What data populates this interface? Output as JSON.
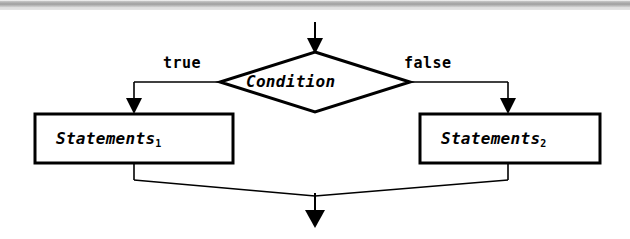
{
  "diagram": {
    "decision": {
      "label": "Condition",
      "shape": "diamond"
    },
    "branches": [
      {
        "label": "true",
        "side": "left"
      },
      {
        "label": "false",
        "side": "right"
      }
    ],
    "processes": [
      {
        "label": "Statements",
        "subscript": "1",
        "side": "left"
      },
      {
        "label": "Statements",
        "subscript": "2",
        "side": "right"
      }
    ],
    "flow": {
      "entry_arrow": "arrow-down-icon",
      "exit_arrow": "arrow-down-icon",
      "true_branch_arrow": "arrow-down-icon",
      "false_branch_arrow": "arrow-down-icon"
    },
    "colors": {
      "stroke": "#000000",
      "background": "#ffffff",
      "connector": "#1a1a1a",
      "scan_edge": "#9a9a9a"
    }
  }
}
